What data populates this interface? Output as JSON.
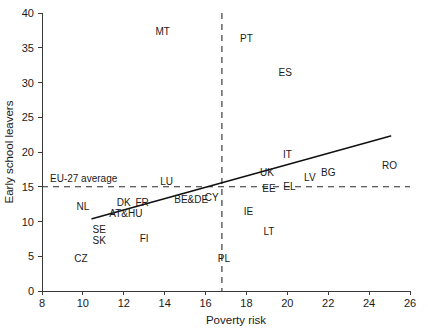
{
  "chart_data": {
    "type": "scatter",
    "title": "",
    "xlabel": "Poverty risk",
    "ylabel": "Early school leavers",
    "xlim": [
      8,
      26
    ],
    "ylim": [
      0,
      40
    ],
    "xticks": [
      8,
      10,
      12,
      14,
      16,
      18,
      20,
      22,
      24,
      26
    ],
    "yticks": [
      0,
      5,
      10,
      15,
      20,
      25,
      30,
      35,
      40
    ],
    "grid": false,
    "legend": "none",
    "point_style": "text-labels-only",
    "points": [
      {
        "label": "MT",
        "x": 13.9,
        "y": 37.3
      },
      {
        "label": "PT",
        "x": 18.0,
        "y": 36.4
      },
      {
        "label": "ES",
        "x": 19.9,
        "y": 31.4
      },
      {
        "label": "IT",
        "x": 20.0,
        "y": 19.6
      },
      {
        "label": "RO",
        "x": 25.0,
        "y": 18.0
      },
      {
        "label": "UK",
        "x": 19.0,
        "y": 17.1
      },
      {
        "label": "BG",
        "x": 22.0,
        "y": 17.1
      },
      {
        "label": "LV",
        "x": 21.1,
        "y": 16.3
      },
      {
        "label": "LU",
        "x": 14.1,
        "y": 15.8
      },
      {
        "label": "EL",
        "x": 20.1,
        "y": 15.0
      },
      {
        "label": "EE",
        "x": 19.1,
        "y": 14.8
      },
      {
        "label": "CY",
        "x": 16.3,
        "y": 13.4
      },
      {
        "label": "BE&DE",
        "x": 15.3,
        "y": 13.1
      },
      {
        "label": "FR",
        "x": 12.9,
        "y": 12.8
      },
      {
        "label": "DK",
        "x": 12.0,
        "y": 12.7
      },
      {
        "label": "NL",
        "x": 10.0,
        "y": 12.1
      },
      {
        "label": "IE",
        "x": 18.1,
        "y": 11.5
      },
      {
        "label": "AT&HU",
        "x": 12.1,
        "y": 11.1
      },
      {
        "label": "SE",
        "x": 10.8,
        "y": 8.8
      },
      {
        "label": "LT",
        "x": 19.1,
        "y": 8.5
      },
      {
        "label": "FI",
        "x": 13.0,
        "y": 7.6
      },
      {
        "label": "SK",
        "x": 10.8,
        "y": 7.3
      },
      {
        "label": "CZ",
        "x": 9.9,
        "y": 4.7
      },
      {
        "label": "PL",
        "x": 16.9,
        "y": 4.7
      }
    ],
    "trend_line": {
      "name": "linear fit",
      "x_start": 10.45,
      "y_start": 10.4,
      "x_end": 25.05,
      "y_end": 22.3
    },
    "reference_lines": [
      {
        "name": "eu-27-average-early-school-leavers",
        "orientation": "horizontal",
        "value": 15,
        "annotation": "EU-27 average"
      },
      {
        "name": "eu-27-average-poverty-risk",
        "orientation": "vertical",
        "value": 16.8,
        "annotation": ""
      }
    ]
  }
}
